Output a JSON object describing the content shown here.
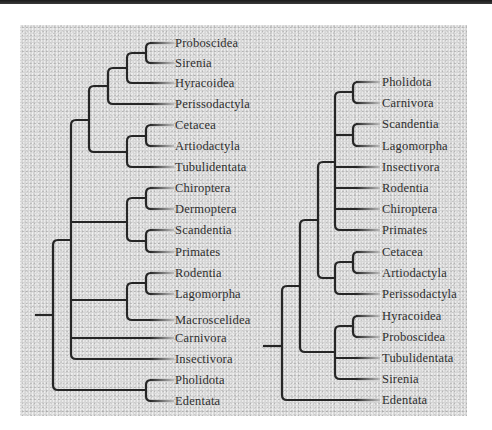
{
  "figure": {
    "style": {
      "line_color": "#262626",
      "line_width": 2.2,
      "text_color": "#2e2e2e",
      "panel_color": "#d6d6d6"
    },
    "trees": [
      {
        "name": "left-tree",
        "label_x": 175,
        "tip_line_end_x": 172,
        "leaves": [
          {
            "label": "Proboscidea",
            "y": 43
          },
          {
            "label": "Sirenia",
            "y": 63
          },
          {
            "label": "Hyracoidea",
            "y": 83
          },
          {
            "label": "Perissodactyla",
            "y": 104
          },
          {
            "label": "Cetacea",
            "y": 125
          },
          {
            "label": "Artiodactyla",
            "y": 146
          },
          {
            "label": "Tubulidentata",
            "y": 167
          },
          {
            "label": "Chiroptera",
            "y": 188
          },
          {
            "label": "Dermoptera",
            "y": 209
          },
          {
            "label": "Scandentia",
            "y": 230
          },
          {
            "label": "Primates",
            "y": 252
          },
          {
            "label": "Rodentia",
            "y": 273
          },
          {
            "label": "Lagomorpha",
            "y": 294
          },
          {
            "label": "Macroscelidea",
            "y": 320
          },
          {
            "label": "Carnivora",
            "y": 338
          },
          {
            "label": "Insectivora",
            "y": 359
          },
          {
            "label": "Pholidota",
            "y": 380
          },
          {
            "label": "Edentata",
            "y": 401
          }
        ],
        "paths": [
          "M35 315 H53",
          "M53 245 Q53 240 58 240 H71",
          "M53 385 Q53 390 58 390 H146",
          "M53 245 V385",
          "M71 125 Q71 120 76 120 H89",
          "M71 125 V354 Q71 359 76 359 H172",
          "M71 222 H127",
          "M71 300 H127",
          "M71 338 H172",
          "M89 91 Q89 86 94 86 H108",
          "M89 91 V147 Q89 152 94 152 H127",
          "M108 73 Q108 68 113 68 H127",
          "M108 73 V99 Q108 104 113 104 H172",
          "M127 58 Q127 53 132 53 H146",
          "M127 58 V78 Q127 83 132 83 H172",
          "M146 48 Q146 43 151 43 H172",
          "M146 48 V58 Q146 63 151 63 H172",
          "M127 141 Q127 136 132 136 H146",
          "M127 141 V162 Q127 167 132 167 H172",
          "M146 130 Q146 125 151 125 H172",
          "M146 130 V141 Q146 146 151 146 H172",
          "M127 203 Q127 198 132 198 H146",
          "M127 203 V236 Q127 241 132 241 H146",
          "M146 193 Q146 188 151 188 H172",
          "M146 193 V204 Q146 209 151 209 H172",
          "M146 235 Q146 230 151 230 H172",
          "M146 235 V247 Q146 252 151 252 H172",
          "M127 288 Q127 283 132 283 H146",
          "M127 288 V315 Q127 320 132 320 H172",
          "M146 278 Q146 273 151 273 H172",
          "M146 278 V289 Q146 294 151 294 H172",
          "M146 385 Q146 380 151 380 H172",
          "M146 385 V396 Q146 401 151 401 H172"
        ]
      },
      {
        "name": "right-tree",
        "label_x": 382,
        "tip_line_end_x": 378,
        "leaves": [
          {
            "label": "Pholidota",
            "y": 82
          },
          {
            "label": "Carnivora",
            "y": 103
          },
          {
            "label": "Scandentia",
            "y": 124
          },
          {
            "label": "Lagomorpha",
            "y": 146
          },
          {
            "label": "Insectivora",
            "y": 167
          },
          {
            "label": "Rodentia",
            "y": 188
          },
          {
            "label": "Chiroptera",
            "y": 209
          },
          {
            "label": "Primates",
            "y": 230
          },
          {
            "label": "Cetacea",
            "y": 252
          },
          {
            "label": "Artiodactyla",
            "y": 273
          },
          {
            "label": "Perissodactyla",
            "y": 294
          },
          {
            "label": "Hyracoidea",
            "y": 316
          },
          {
            "label": "Proboscidea",
            "y": 337
          },
          {
            "label": "Tubulidentata",
            "y": 358
          },
          {
            "label": "Sirenia",
            "y": 379
          },
          {
            "label": "Edentata",
            "y": 400
          }
        ],
        "paths": [
          "M263 346 H282",
          "M282 291 Q282 286 287 286 H300",
          "M282 291 V395 Q282 400 287 400 H378",
          "M300 225 Q300 220 305 220 H318",
          "M300 225 V347 Q300 352 305 352 H335",
          "M318 167 Q318 162 323 162 H335",
          "M318 167 V273 Q318 278 323 278 H335",
          "M335 97 Q335 92 340 92 H353",
          "M335 97 V225 Q335 230 340 230 H378",
          "M335 135 H353",
          "M335 167 H378",
          "M335 188 H378",
          "M335 209 H378",
          "M353 87 Q353 82 358 82 H378",
          "M353 87 V98 Q353 103 358 103 H378",
          "M353 129 Q353 124 358 124 H378",
          "M353 129 V141 Q353 146 358 146 H378",
          "M335 267 Q335 262 340 262 H353",
          "M335 267 V289 Q335 294 340 294 H378",
          "M353 257 Q353 252 358 252 H378",
          "M353 257 V268 Q353 273 358 273 H378",
          "M335 331 Q335 326 340 326 H353",
          "M335 331 V374 Q335 379 340 379 H378",
          "M335 358 H378",
          "M353 321 Q353 316 358 316 H378",
          "M353 321 V332 Q353 337 358 337 H378"
        ]
      }
    ]
  }
}
